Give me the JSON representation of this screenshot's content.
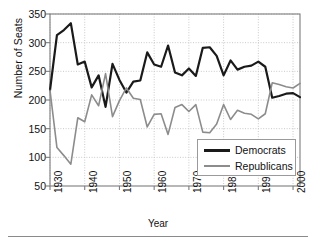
{
  "chart_data": {
    "type": "line",
    "title": "",
    "xlabel": "Year",
    "ylabel": "Number of Seats",
    "xlim": [
      1930,
      2002
    ],
    "ylim": [
      50,
      350
    ],
    "xticks": [
      1930,
      1940,
      1950,
      1960,
      1970,
      1980,
      1990,
      2000
    ],
    "yticks": [
      50,
      100,
      150,
      200,
      250,
      300,
      350
    ],
    "grid": true,
    "legend_position": "lower right",
    "x": [
      1930,
      1932,
      1934,
      1936,
      1938,
      1940,
      1942,
      1944,
      1946,
      1948,
      1950,
      1952,
      1954,
      1956,
      1958,
      1960,
      1962,
      1964,
      1966,
      1968,
      1970,
      1972,
      1974,
      1976,
      1978,
      1980,
      1982,
      1984,
      1986,
      1988,
      1990,
      1992,
      1994,
      1996,
      1998,
      2000,
      2002
    ],
    "series": [
      {
        "name": "Democrats",
        "color": "#1a1a1a",
        "values": [
          217,
          313,
          322,
          334,
          262,
          267,
          222,
          243,
          188,
          263,
          235,
          213,
          232,
          234,
          283,
          262,
          258,
          295,
          248,
          243,
          255,
          242,
          291,
          292,
          277,
          243,
          269,
          253,
          258,
          260,
          267,
          258,
          204,
          207,
          211,
          212,
          205
        ]
      },
      {
        "name": "Republicans",
        "color": "#8c8c8c",
        "values": [
          217,
          117,
          103,
          88,
          169,
          162,
          209,
          190,
          246,
          171,
          199,
          221,
          203,
          201,
          153,
          175,
          176,
          140,
          187,
          192,
          180,
          192,
          144,
          143,
          158,
          192,
          166,
          182,
          177,
          175,
          167,
          176,
          230,
          227,
          223,
          221,
          229
        ]
      }
    ],
    "legend": [
      {
        "label": "Democrats",
        "color": "#1a1a1a",
        "width": 3
      },
      {
        "label": "Republicans",
        "color": "#8c8c8c",
        "width": 2
      }
    ]
  },
  "axis": {
    "ylabel_text": "Number of Seats",
    "xlabel_text": "Year",
    "ytick_labels": [
      "350",
      "300",
      "250",
      "200",
      "150",
      "100",
      "50"
    ],
    "xtick_labels": [
      "1930",
      "1940",
      "1950",
      "1960",
      "1970",
      "1980",
      "1990",
      "2000"
    ]
  },
  "colors": {
    "democrats": "#1a1a1a",
    "republicans": "#8c8c8c",
    "axis": "#7d7d7d",
    "grid": "#c9c9c9",
    "text": "#111111",
    "background": "#ffffff"
  }
}
